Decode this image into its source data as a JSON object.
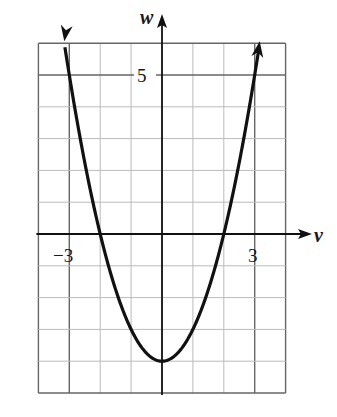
{
  "chart_data": {
    "type": "line",
    "title": "",
    "xlabel": "v",
    "ylabel": "w",
    "function": "w = v^2 - 4",
    "xlim": [
      -4,
      4
    ],
    "ylim": [
      -5,
      6
    ],
    "grid": true,
    "x_tick_labels": [
      {
        "value": -3,
        "label": "−3"
      },
      {
        "value": 3,
        "label": "3"
      }
    ],
    "y_tick_labels": [
      {
        "value": 5,
        "label": "5"
      }
    ],
    "series": [
      {
        "name": "parabola",
        "x": [
          -3.16,
          -3,
          -2.5,
          -2,
          -1.5,
          -1,
          -0.5,
          0,
          0.5,
          1,
          1.5,
          2,
          2.5,
          3,
          3.16
        ],
        "y": [
          6,
          5,
          2.25,
          0,
          -1.75,
          -3,
          -3.75,
          -4,
          -3.75,
          -3,
          -1.75,
          0,
          2.25,
          5,
          6
        ]
      }
    ],
    "annotations": [
      "vertex at (0, -4)",
      "v-intercepts at (-2, 0) and (2, 0)",
      "arrows on both ends indicating curve continues upward"
    ]
  },
  "labels": {
    "x_axis": "v",
    "y_axis": "w",
    "tick_neg3": "−3",
    "tick_pos3": "3",
    "tick_5": "5"
  }
}
